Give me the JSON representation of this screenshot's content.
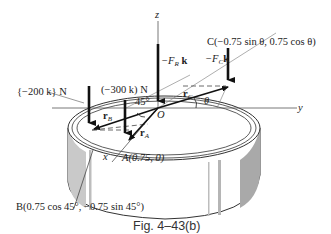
{
  "diagram": {
    "axes": {
      "z": "z",
      "y": "y",
      "x": "x",
      "origin": "O"
    },
    "forces": {
      "F200": "{−200 k} N",
      "F300": "(−300 k) N",
      "FR": "−F",
      "FR_sub": "R",
      "FR_unit": " k",
      "FC": "−F",
      "FC_sub": "C",
      "FC_unit": "k"
    },
    "vectors": {
      "rA": "r",
      "rA_sub": "A",
      "rB": "r",
      "rB_sub": "B",
      "rC": "r",
      "rC_sub": "C"
    },
    "angles": {
      "a45": "45°",
      "theta": "θ"
    },
    "points": {
      "A": "A(0.75, 0)",
      "B": "B(0.75 cos 45°, −0.75 sin 45°)",
      "C": "C(−0.75 sin θ, 0.75 cos θ)"
    },
    "caption": "Fig. 4–43(b)"
  }
}
